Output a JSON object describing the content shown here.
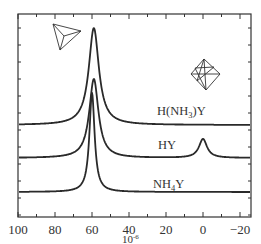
{
  "chart_data": {
    "type": "line",
    "title": "",
    "xlabel": "10^-6",
    "ylabel": "",
    "x_unit_display": "10",
    "x_unit_exponent": "-6",
    "xlim": [
      100,
      -26
    ],
    "x_reversed": true,
    "x_ticks": [
      100,
      80,
      60,
      40,
      20,
      0,
      -20
    ],
    "x_tick_labels": [
      "100",
      "80",
      "60",
      "40",
      "20",
      "0",
      "−20"
    ],
    "grid": false,
    "legend": "inline labels",
    "series": [
      {
        "name": "H(NH3)Y",
        "label_main": "H(NH",
        "label_sub": "3",
        "label_tail": ")Y",
        "baseline_px": 125,
        "peaks": [
          {
            "position_ppm": 59,
            "relative_height": 1.0,
            "height_px": 97,
            "hwhm_ppm": 3.3
          }
        ]
      },
      {
        "name": "HY",
        "label_main": "HY",
        "label_sub": "",
        "label_tail": "",
        "baseline_px": 158,
        "peaks": [
          {
            "position_ppm": 59,
            "relative_height": 0.81,
            "height_px": 79,
            "hwhm_ppm": 3.0
          },
          {
            "position_ppm": 0,
            "relative_height": 0.19,
            "height_px": 19,
            "hwhm_ppm": 2.6
          }
        ]
      },
      {
        "name": "NH4Y",
        "label_main": "NH",
        "label_sub": "4",
        "label_tail": "Y",
        "baseline_px": 192,
        "peaks": [
          {
            "position_ppm": 60,
            "relative_height": 1.0,
            "height_px": 99,
            "hwhm_ppm": 1.7
          }
        ]
      }
    ],
    "annotations": [
      {
        "type": "icon",
        "name": "tetrahedron",
        "meaning": "tetrahedral framework Al",
        "near_ppm": 60
      },
      {
        "type": "icon",
        "name": "octahedron",
        "meaning": "octahedral extra-framework Al",
        "near_ppm": 0
      }
    ]
  }
}
